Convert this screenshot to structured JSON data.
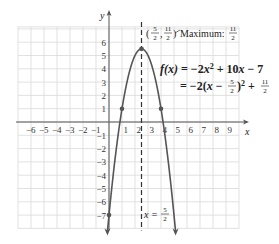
{
  "chart_data": {
    "type": "line",
    "title": "",
    "xlabel": "x",
    "ylabel": "y",
    "xlim": [
      -7,
      10
    ],
    "ylim": [
      -8,
      7
    ],
    "grid": true,
    "x_ticks": [
      "-6",
      "-5",
      "-4",
      "-3",
      "-2",
      "-1",
      "1",
      "2",
      "3",
      "4",
      "5",
      "6",
      "7",
      "8",
      "9"
    ],
    "y_ticks": [
      "6",
      "5",
      "4",
      "3",
      "2",
      "1",
      "-1",
      "-2",
      "-3",
      "-4",
      "-5",
      "-6",
      "-7"
    ],
    "series": [
      {
        "name": "f(x) = -2x^2 + 10x - 7",
        "function": "-2x^2 + 10x - 7",
        "x": [
          0,
          1,
          2,
          2.5,
          3,
          4,
          5
        ],
        "y": [
          -7,
          1,
          5,
          5.5,
          5,
          1,
          -7
        ]
      }
    ],
    "points": [
      {
        "x": 0,
        "y": -7
      },
      {
        "x": 1,
        "y": 1
      },
      {
        "x": 2.5,
        "y": 5.5
      },
      {
        "x": 4,
        "y": 1
      }
    ],
    "axis_of_symmetry": {
      "x": 2.5,
      "label": "x = 5/2"
    },
    "annotations": {
      "vertex_label": "(5/2, 11/2)",
      "maximum_label": "Maximum: 11/2",
      "equation_line1": "f(x) = −2x² + 10x − 7",
      "equation_line2": "= −2(x − 5/2)² + 11/2"
    }
  },
  "labels": {
    "x_axis": "x",
    "y_axis": "y",
    "maximum_text": "Maximum:",
    "eq1_lhs": "f(x)",
    "eq1_rhs": "= −2x² + 10x − 7",
    "eq2": "= −2(x − ",
    "eq2_b": ")² + ",
    "sym_x": "x =",
    "frac5": "5",
    "frac2": "2",
    "frac11": "11"
  }
}
